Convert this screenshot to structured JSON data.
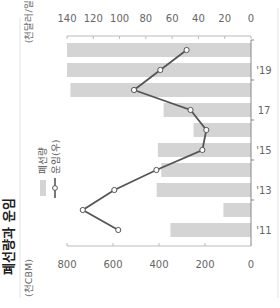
{
  "chart_data": {
    "type": "bar",
    "title": "폐선량과 운임",
    "orientation": "rotated-90-ccw",
    "categories": [
      "'11",
      "'12",
      "'13",
      "'14",
      "'15",
      "'16",
      "17",
      "'18",
      "'19",
      "'20"
    ],
    "tick_labels": [
      "'11",
      "",
      "'13",
      "",
      "'15",
      "",
      "17",
      "",
      "'19",
      ""
    ],
    "series": [
      {
        "name": "폐선량",
        "type": "bar",
        "axis": "left",
        "color": "#d4d4d4",
        "values": [
          350,
          120,
          410,
          390,
          405,
          250,
          380,
          785,
          800,
          800
        ]
      },
      {
        "name": "운임(우)",
        "type": "line",
        "axis": "right",
        "color": "#555555",
        "values": [
          101,
          128,
          104,
          72,
          37,
          34,
          46,
          89,
          69,
          49
        ]
      }
    ],
    "left_axis": {
      "label": "(천CBM)",
      "ylim": [
        0,
        800
      ],
      "ticks": [
        0,
        200,
        400,
        600,
        800
      ]
    },
    "right_axis": {
      "label": "(천달러/일)",
      "ylim": [
        0,
        140
      ],
      "ticks": [
        0,
        20,
        40,
        60,
        80,
        100,
        120,
        140
      ]
    },
    "legend": {
      "position": "top-left",
      "entries": [
        "폐선량",
        "운임(우)"
      ]
    },
    "grid": false
  }
}
